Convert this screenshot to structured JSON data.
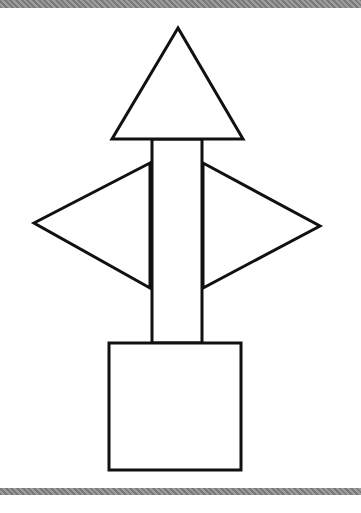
{
  "diagram": {
    "stroke_color": "#111111",
    "fill_color": "#ffffff",
    "band_color": "#8a8a8a",
    "shapes": {
      "top_triangle": {
        "points": "178,28 112,139 243,139"
      },
      "stem": {
        "x": 152,
        "y": 139,
        "width": 50,
        "height": 204
      },
      "left_triangle": {
        "points": "150,163 34,223 150,288"
      },
      "right_triangle": {
        "points": "203,163 320,226 203,288"
      },
      "base_square": {
        "x": 109,
        "y": 343,
        "width": 132,
        "height": 127
      }
    }
  }
}
